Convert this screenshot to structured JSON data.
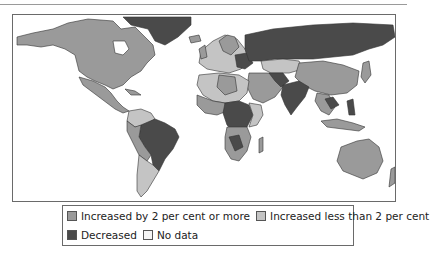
{
  "map": {
    "title": "",
    "colors": {
      "increased_2_or_more": "#9a9a9a",
      "increased_less_than_2": "#c4c4c4",
      "decreased": "#4a4a4a",
      "no_data": "#f4f4f4",
      "ocean": "#ffffff",
      "border": "#333333"
    }
  },
  "legend": {
    "items": [
      {
        "label": "Increased by 2 per cent or more",
        "color": "#9a9a9a"
      },
      {
        "label": "Increased less than 2 per cent",
        "color": "#c4c4c4"
      },
      {
        "label": "Decreased",
        "color": "#4a4a4a"
      },
      {
        "label": "No data",
        "color": "#f4f4f4"
      }
    ]
  }
}
